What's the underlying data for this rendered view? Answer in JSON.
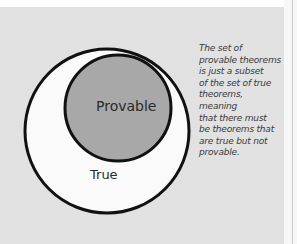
{
  "diagram": {
    "type": "nested-set-venn",
    "outer_set": {
      "label": "True",
      "fill": "#fafafa",
      "stroke": "#111111"
    },
    "inner_set": {
      "label": "Provable",
      "fill": "#a8a8a8",
      "stroke": "#111111"
    },
    "annotation": "The set of provable theorems is just a subset of the set of true theorems, meaning that there must be theorems that are true but not provable.",
    "annotation_lines": [
      "The set of",
      "provable theorems",
      "is just a subset",
      "of the set of true",
      "theorems, meaning",
      "that there must",
      "be theorems that",
      "are true but not",
      "provable."
    ],
    "background": "#e0e0e0"
  }
}
